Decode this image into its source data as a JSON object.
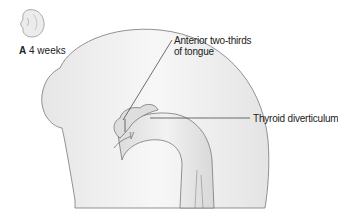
{
  "figure": {
    "panel_letter": "A",
    "stage": "4 weeks",
    "labels": [
      {
        "line1": "Anterior two-thirds",
        "line2": "of tongue"
      },
      {
        "line1": "Thyroid diverticulum"
      }
    ]
  }
}
